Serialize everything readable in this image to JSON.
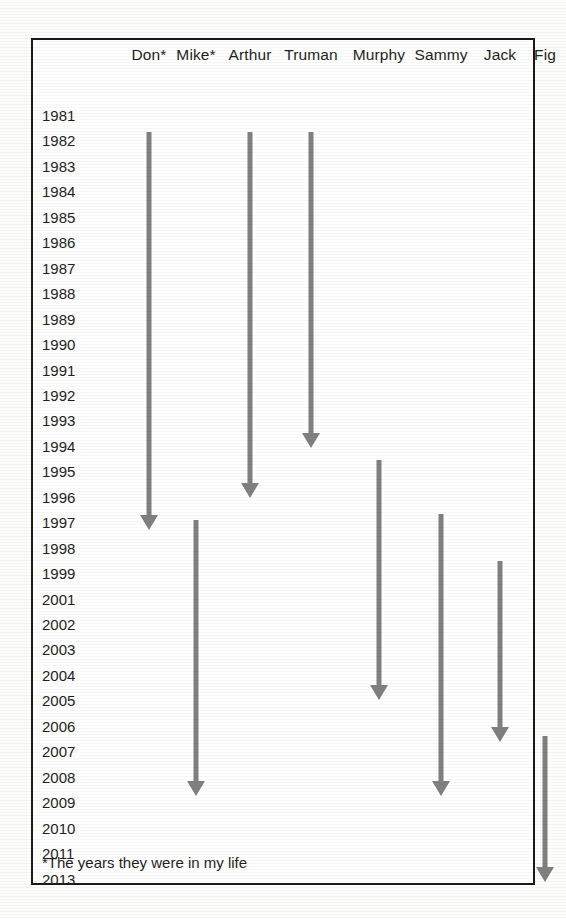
{
  "chart_data": {
    "type": "bar",
    "title": "",
    "subtitle": "",
    "xlabel": "",
    "ylabel": "",
    "orientation": "vertical-timeline",
    "grid": false,
    "legend_position": "none",
    "axis_note": "Vertical axis is years listed top-to-bottom; each named column has a downward arrow spanning the start year to the end year.",
    "categories": [
      "Don*",
      "Mike*",
      "Arthur",
      "Truman",
      "Murphy",
      "Sammy",
      "Jack",
      "Fig"
    ],
    "y_tick_labels": [
      "1981",
      "1982",
      "1983",
      "1984",
      "1985",
      "1986",
      "1987",
      "1988",
      "1989",
      "1990",
      "1991",
      "1992",
      "1993",
      "1994",
      "1995",
      "1996",
      "1997",
      "1998",
      "1999",
      "2001",
      "2002",
      "2003",
      "2004",
      "2005",
      "2006",
      "2007",
      "2008",
      "2009",
      "2010",
      "2011",
      "2013"
    ],
    "ylim": [
      "1981",
      "2013"
    ],
    "missing_years": [
      "2000",
      "2012"
    ],
    "series": [
      {
        "name": "Don*",
        "start_year": "1982",
        "end_year": "1997",
        "duration_years": 15
      },
      {
        "name": "Mike*",
        "start_year": "1997",
        "end_year": "2009",
        "duration_years": 12
      },
      {
        "name": "Arthur",
        "start_year": "1982",
        "end_year": "1996",
        "duration_years": 14
      },
      {
        "name": "Truman",
        "start_year": "1982",
        "end_year": "1993",
        "duration_years": 11
      },
      {
        "name": "Murphy",
        "start_year": "1995",
        "end_year": "2005",
        "duration_years": 10
      },
      {
        "name": "Sammy",
        "start_year": "1997",
        "end_year": "2009",
        "duration_years": 12
      },
      {
        "name": "Jack",
        "start_year": "1999",
        "end_year": "2007",
        "duration_years": 8
      },
      {
        "name": "Fig",
        "start_year": "2007",
        "end_year": "2013",
        "duration_years": 6
      }
    ],
    "annotations": [
      "*The years they were in my life"
    ]
  },
  "chart": {
    "footnote": "*The years they were in my life",
    "colors": {
      "arrow": "#808080",
      "border": "#1a1a1a",
      "text": "#231f20",
      "background": "#ffffff"
    },
    "years": [
      {
        "label": "1981"
      },
      {
        "label": "1982"
      },
      {
        "label": "1983"
      },
      {
        "label": "1984"
      },
      {
        "label": "1985"
      },
      {
        "label": "1986"
      },
      {
        "label": "1987"
      },
      {
        "label": "1988"
      },
      {
        "label": "1989"
      },
      {
        "label": "1990"
      },
      {
        "label": "1991"
      },
      {
        "label": "1992"
      },
      {
        "label": "1993"
      },
      {
        "label": "1994"
      },
      {
        "label": "1995"
      },
      {
        "label": "1996"
      },
      {
        "label": "1997"
      },
      {
        "label": "1998"
      },
      {
        "label": "1999"
      },
      {
        "label": "2001"
      },
      {
        "label": "2002"
      },
      {
        "label": "2003"
      },
      {
        "label": "2004"
      },
      {
        "label": "2005"
      },
      {
        "label": "2006"
      },
      {
        "label": "2007"
      },
      {
        "label": "2008"
      },
      {
        "label": "2009"
      },
      {
        "label": "2010"
      },
      {
        "label": "2011"
      },
      {
        "label": "2013"
      }
    ],
    "columns": [
      {
        "label": "Don*",
        "x": 116,
        "top": 92,
        "bottom": 490
      },
      {
        "label": "Mike*",
        "x": 163,
        "top": 480,
        "bottom": 756
      },
      {
        "label": "Arthur",
        "x": 217,
        "top": 92,
        "bottom": 458
      },
      {
        "label": "Truman",
        "x": 278,
        "top": 92,
        "bottom": 408
      },
      {
        "label": "Murphy",
        "x": 346,
        "top": 420,
        "bottom": 660
      },
      {
        "label": "Sammy",
        "x": 408,
        "top": 474,
        "bottom": 756
      },
      {
        "label": "Jack",
        "x": 467,
        "top": 521,
        "bottom": 702
      },
      {
        "label": "Fig",
        "x": 512,
        "top": 696,
        "bottom": 842
      }
    ]
  }
}
